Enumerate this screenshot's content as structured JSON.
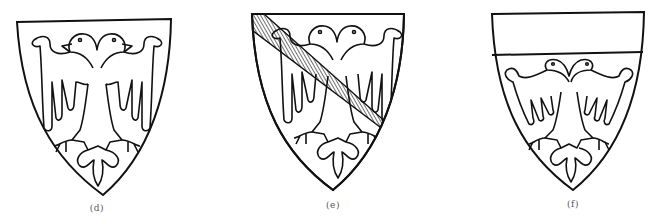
{
  "figures": [
    {
      "id": "d",
      "label": "(d)",
      "description": "Shield with double-headed eagle displayed",
      "variant": "plain"
    },
    {
      "id": "e",
      "label": "(e)",
      "description": "Shield with double-headed eagle, debruised by a hatched bend",
      "variant": "bend"
    },
    {
      "id": "f",
      "label": "(f)",
      "description": "Shield with a plain chief above a double-headed eagle",
      "variant": "chief"
    }
  ],
  "colors": {
    "ink": "#111111",
    "field": "#ffffff",
    "label": "#555555"
  }
}
